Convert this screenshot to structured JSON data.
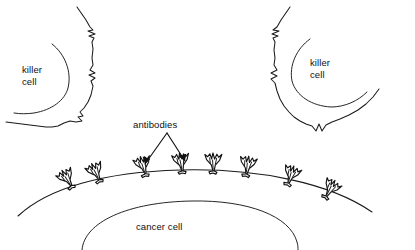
{
  "figure": {
    "type": "biological-line-diagram",
    "background_color": "#ffffff",
    "stroke_color": "#1a1a1a",
    "width": 415,
    "height": 250
  },
  "labels": {
    "killer_cell_left_line1": "killer",
    "killer_cell_left_line2": "cell",
    "killer_cell_right_line1": "killer",
    "killer_cell_right_line2": "cell",
    "antibodies": "antibodies",
    "cancer_cell": "cancer cell"
  },
  "structures": {
    "killer_cell_left": {
      "name": "killer cell",
      "position": "upper-left",
      "membrane_style": "ruffled",
      "has_inner_arc": true
    },
    "killer_cell_right": {
      "name": "killer cell",
      "position": "upper-right",
      "membrane_style": "ruffled",
      "has_inner_arc": true
    },
    "cancer_cell": {
      "name": "cancer cell",
      "position": "bottom-center",
      "membrane_style": "smooth-arc",
      "has_inner_arc": true,
      "antibody_count": 8
    }
  },
  "annotations": {
    "antibodies_pointer": {
      "label": "antibodies",
      "arrow_count": 2,
      "points_to": "cancer cell surface antibodies"
    }
  }
}
